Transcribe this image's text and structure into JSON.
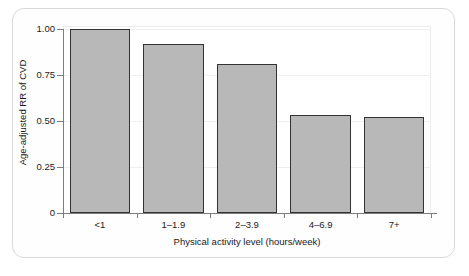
{
  "chart_data": {
    "type": "bar",
    "title": "",
    "categories": [
      "<1",
      "1–1.9",
      "2–3.9",
      "4–6.9",
      "7+"
    ],
    "values": [
      1.0,
      0.92,
      0.81,
      0.53,
      0.52
    ],
    "xlabel": "Physical activity level (hours/week)",
    "ylabel": "Age-adjusted RR of CVD",
    "ylim": [
      0,
      1.0
    ],
    "yticks": [
      0,
      0.25,
      0.5,
      0.75,
      1.0
    ],
    "ytick_labels": [
      "0",
      "0.25",
      "0.50",
      "0.75",
      "1.00"
    ],
    "grid": true,
    "legend": null,
    "bar_color": "#b8b8b8",
    "bar_edge_color": "#333333",
    "gridline_color": "#efefef",
    "axis_color": "#7d7d7d",
    "background": "#ffffff"
  }
}
